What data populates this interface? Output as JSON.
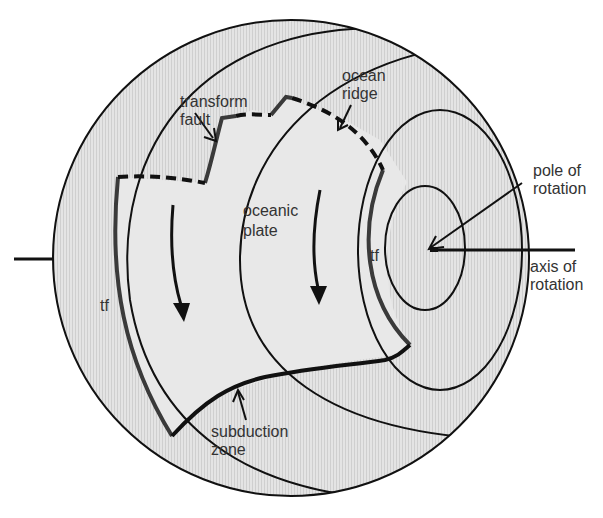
{
  "diagram": {
    "labels": {
      "transform_fault": [
        "transform",
        "fault"
      ],
      "ocean_ridge": [
        "ocean",
        "ridge"
      ],
      "pole_of_rotation": [
        "pole of",
        "rotation"
      ],
      "axis_of_rotation": [
        "axis of",
        "rotation"
      ],
      "oceanic_plate": [
        "oceanic",
        "plate"
      ],
      "subduction_zone": [
        "subduction",
        "zone"
      ],
      "tf_left": "tf",
      "tf_right": "tf"
    },
    "colors": {
      "sphere_fill": "#dcdcdc",
      "plate_fill": "#e6e6e6",
      "line": "#111111",
      "fault_line": "#3a3a3a",
      "text": "#333333"
    }
  }
}
